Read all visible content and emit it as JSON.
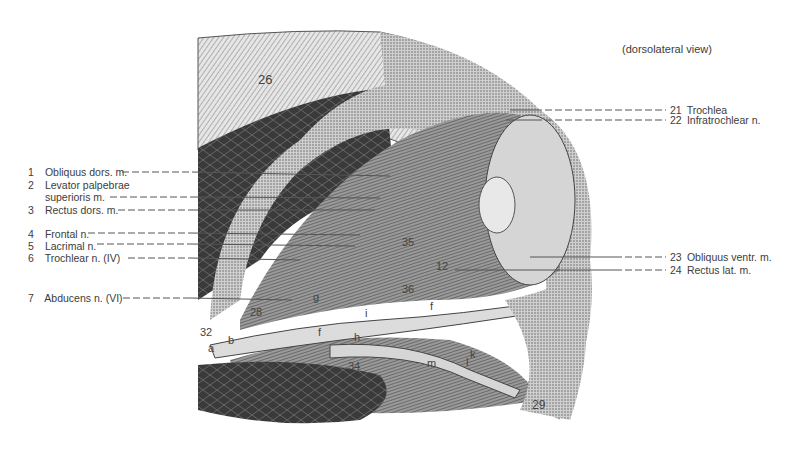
{
  "figure": {
    "view_caption": "(dorsolateral view)",
    "left_labels": [
      {
        "num": "1",
        "text": "Obliquus dors. m."
      },
      {
        "num": "2",
        "text": "Levator palpebrae"
      },
      {
        "num": "",
        "text": "superioris m."
      },
      {
        "num": "3",
        "text": "Rectus dors. m."
      },
      {
        "num": "4",
        "text": "Frontal n."
      },
      {
        "num": "5",
        "text": "Lacrimal n."
      },
      {
        "num": "6",
        "text": "Trochlear n. (IV)"
      },
      {
        "num": "7",
        "text": "Abducens n. (VI)"
      }
    ],
    "right_labels": [
      {
        "num": "21",
        "text": "Trochlea"
      },
      {
        "num": "22",
        "text": "Infratrochlear n."
      },
      {
        "num": "23",
        "text": "Obliquus ventr. m."
      },
      {
        "num": "24",
        "text": "Rectus lat. m."
      }
    ],
    "inner_labels": {
      "l26": "26",
      "l28": "28",
      "l32": "32",
      "l33": "33",
      "l34": "34",
      "l35": "35",
      "l36": "36",
      "l12": "12",
      "l29": "29",
      "la": "a",
      "lb": "b",
      "lf1": "f",
      "lf2": "f",
      "lg": "g",
      "lh": "h",
      "li": "i",
      "lk": "k",
      "ll": "l",
      "lm": "m"
    },
    "colors": {
      "ink": "#3c3c3c",
      "dark_tissue": "#2e2e2e",
      "mid_tissue": "#6a6a6a",
      "light_tissue": "#bdbdbd",
      "nerve": "#d8d8d8"
    }
  }
}
